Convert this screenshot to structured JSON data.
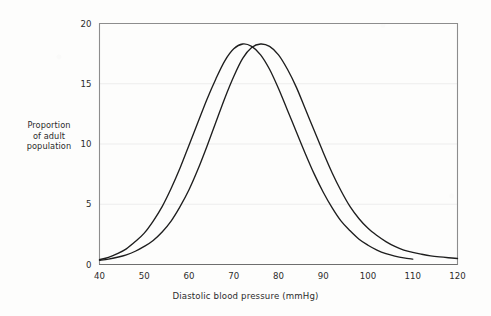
{
  "chart_data": {
    "type": "line",
    "title": "",
    "subtitle": "",
    "xlabel": "Diastolic blood pressure (mmHg)",
    "ylabel": "Proportion of adult population",
    "ylabel_lines": [
      "Proportion",
      "of adult",
      "population"
    ],
    "xlim": [
      40,
      120
    ],
    "ylim": [
      0,
      20
    ],
    "xticks": [
      40,
      50,
      60,
      70,
      80,
      90,
      100,
      110,
      120
    ],
    "yticks": [
      0,
      5,
      10,
      15,
      20
    ],
    "xtick_labels": [
      "40",
      "50",
      "60",
      "70",
      "80",
      "90",
      "100",
      "110",
      "120"
    ],
    "ytick_labels": [
      "0",
      "5",
      "10",
      "15",
      "20"
    ],
    "grid": "horizontal-faint",
    "legend": "none",
    "line_color": "#1e1e1e",
    "frame_color": "#8d8d8d",
    "grid_color": "#ededed",
    "series": [
      {
        "name": "curve-left",
        "peak_x": 70,
        "peak_y": 18.3,
        "sigma": 10.0,
        "x_start": 40,
        "x_end": 110,
        "x": [
          40,
          42,
          44,
          46,
          48,
          50,
          52,
          54,
          56,
          58,
          60,
          62,
          64,
          66,
          68,
          70,
          72,
          74,
          76,
          78,
          80,
          82,
          84,
          86,
          88,
          90,
          92,
          94,
          96,
          98,
          100,
          102,
          104,
          106,
          108,
          110
        ],
        "values": [
          0.4,
          0.6,
          0.9,
          1.3,
          1.9,
          2.6,
          3.6,
          4.8,
          6.3,
          8.0,
          9.9,
          11.8,
          13.7,
          15.4,
          16.9,
          17.9,
          18.3,
          18.1,
          17.4,
          16.2,
          14.6,
          12.8,
          11.0,
          9.2,
          7.5,
          6.0,
          4.7,
          3.6,
          2.8,
          2.1,
          1.6,
          1.2,
          0.9,
          0.7,
          0.55,
          0.45
        ]
      },
      {
        "name": "curve-right",
        "peak_x": 76,
        "peak_y": 18.3,
        "sigma": 10.0,
        "x_start": 40,
        "x_end": 120,
        "x": [
          40,
          42,
          44,
          46,
          48,
          50,
          52,
          54,
          56,
          58,
          60,
          62,
          64,
          66,
          68,
          70,
          72,
          74,
          76,
          78,
          80,
          82,
          84,
          86,
          88,
          90,
          92,
          94,
          96,
          98,
          100,
          102,
          104,
          106,
          108,
          110,
          112,
          114,
          116,
          118,
          120
        ],
        "values": [
          0.35,
          0.45,
          0.6,
          0.8,
          1.1,
          1.5,
          2.0,
          2.7,
          3.6,
          4.8,
          6.2,
          7.9,
          9.8,
          11.8,
          13.8,
          15.6,
          17.1,
          18.0,
          18.3,
          18.1,
          17.4,
          16.2,
          14.7,
          12.9,
          11.1,
          9.3,
          7.6,
          6.1,
          4.8,
          3.8,
          3.0,
          2.4,
          1.9,
          1.5,
          1.2,
          1.0,
          0.85,
          0.72,
          0.63,
          0.56,
          0.5
        ]
      }
    ]
  }
}
